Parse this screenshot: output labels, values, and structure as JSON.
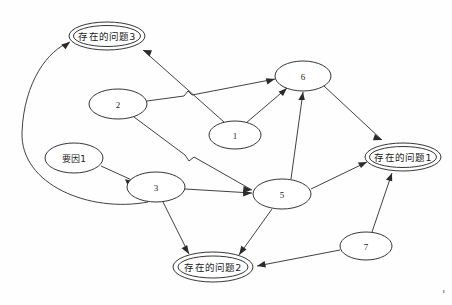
{
  "diagram": {
    "type": "directed-graph",
    "background_color": "#fefefe",
    "stroke_color": "#2b2b2b",
    "width": 452,
    "height": 305,
    "nodes": [
      {
        "id": "p3",
        "label": "存在的问题3",
        "shape": "double-ellipse",
        "cx": 107,
        "cy": 36,
        "rx": 38,
        "ry": 14,
        "kind": "problem"
      },
      {
        "id": "n2",
        "label": "2",
        "shape": "ellipse",
        "cx": 118,
        "cy": 104,
        "rx": 29,
        "ry": 15,
        "kind": "factor"
      },
      {
        "id": "n6",
        "label": "6",
        "shape": "ellipse",
        "cx": 303,
        "cy": 76,
        "rx": 28,
        "ry": 15,
        "kind": "factor"
      },
      {
        "id": "n1",
        "label": "1",
        "shape": "ellipse",
        "cx": 235,
        "cy": 135,
        "rx": 26,
        "ry": 14,
        "kind": "factor"
      },
      {
        "id": "y1",
        "label": "要因1",
        "shape": "ellipse",
        "cx": 74,
        "cy": 158,
        "rx": 29,
        "ry": 15,
        "kind": "cause"
      },
      {
        "id": "n3",
        "label": "3",
        "shape": "ellipse",
        "cx": 156,
        "cy": 187,
        "rx": 29,
        "ry": 15,
        "kind": "factor"
      },
      {
        "id": "n5",
        "label": "5",
        "shape": "ellipse",
        "cx": 282,
        "cy": 194,
        "rx": 29,
        "ry": 15,
        "kind": "factor"
      },
      {
        "id": "p1",
        "label": "存在的问题1",
        "shape": "double-ellipse",
        "cx": 403,
        "cy": 157,
        "rx": 38,
        "ry": 14,
        "kind": "problem"
      },
      {
        "id": "n7",
        "label": "7",
        "shape": "ellipse",
        "cx": 366,
        "cy": 246,
        "rx": 26,
        "ry": 14,
        "kind": "factor"
      },
      {
        "id": "p2",
        "label": "存在的问题2",
        "shape": "double-ellipse",
        "cx": 213,
        "cy": 267,
        "rx": 40,
        "ry": 14,
        "kind": "problem"
      }
    ],
    "edges": [
      {
        "from": "y1",
        "to": "n3",
        "style": "straight"
      },
      {
        "from": "n3",
        "to": "p3",
        "style": "long-left-arc"
      },
      {
        "from": "n1",
        "to": "p3",
        "style": "straight"
      },
      {
        "from": "n2",
        "to": "n6",
        "style": "straight-with-jump"
      },
      {
        "from": "n2",
        "to": "n5",
        "style": "straight-with-jump"
      },
      {
        "from": "n1",
        "to": "n6",
        "style": "straight"
      },
      {
        "from": "n3",
        "to": "n5",
        "style": "straight"
      },
      {
        "from": "n5",
        "to": "n6",
        "style": "straight"
      },
      {
        "from": "n6",
        "to": "p1",
        "style": "straight"
      },
      {
        "from": "n5",
        "to": "p1",
        "style": "straight"
      },
      {
        "from": "n7",
        "to": "p1",
        "style": "straight"
      },
      {
        "from": "n3",
        "to": "p2",
        "style": "straight"
      },
      {
        "from": "n5",
        "to": "p2",
        "style": "straight"
      },
      {
        "from": "n7",
        "to": "p2",
        "style": "straight"
      }
    ]
  }
}
